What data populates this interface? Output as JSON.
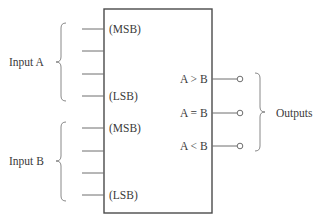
{
  "diagram": {
    "type": "magnitude-comparator-block",
    "input_a": {
      "label": "Input A",
      "msb_label": "(MSB)",
      "lsb_label": "(LSB)",
      "line_count": 4
    },
    "input_b": {
      "label": "Input B",
      "msb_label": "(MSB)",
      "lsb_label": "(LSB)",
      "line_count": 4
    },
    "outputs": {
      "label": "Outputs",
      "items": [
        {
          "label": "A > B"
        },
        {
          "label": "A = B"
        },
        {
          "label": "A < B"
        }
      ]
    },
    "colors": {
      "line": "#6e6e6e",
      "box": "#4a4a4a",
      "text": "#3a3a3a"
    }
  }
}
